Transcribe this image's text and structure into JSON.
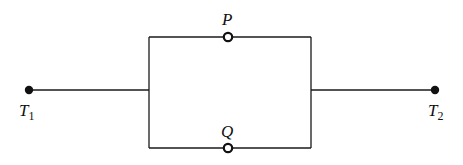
{
  "diagram": {
    "type": "parallel-circuit",
    "terminals": [
      {
        "id": "T1",
        "label": "T",
        "subscript": "1"
      },
      {
        "id": "T2",
        "label": "T",
        "subscript": "2"
      }
    ],
    "switches": [
      {
        "id": "P",
        "label": "P",
        "branch": "upper"
      },
      {
        "id": "Q",
        "label": "Q",
        "branch": "lower"
      }
    ],
    "colors": {
      "line": "#1a1a1a",
      "background": "#ffffff"
    }
  }
}
